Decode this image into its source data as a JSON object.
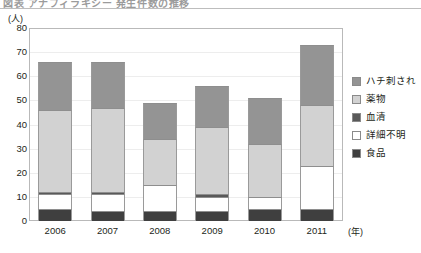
{
  "title": "図表 アナフィラキシー 発生件数の推移",
  "y_unit": "(人)",
  "x_unit": "(年)",
  "legend": [
    {
      "label": "ハチ刺され",
      "color": "#949494"
    },
    {
      "label": "薬物",
      "color": "#d2d2d2"
    },
    {
      "label": "血清",
      "color": "#595959"
    },
    {
      "label": "詳細不明",
      "color": "#ffffff"
    },
    {
      "label": "食品",
      "color": "#3f3f3f"
    }
  ],
  "chart_data": {
    "type": "bar",
    "stacked": true,
    "title": "図表 アナフィラキシー 発生件数の推移",
    "xlabel": "(年)",
    "ylabel": "(人)",
    "ylim": [
      0,
      80
    ],
    "yticks": [
      0,
      10,
      20,
      30,
      40,
      50,
      60,
      70,
      80
    ],
    "grid": true,
    "legend_position": "right",
    "categories": [
      "2006",
      "2007",
      "2008",
      "2009",
      "2010",
      "2011"
    ],
    "series": [
      {
        "name": "食品",
        "color": "#3f3f3f",
        "values": [
          5,
          4,
          4,
          4,
          5,
          5
        ]
      },
      {
        "name": "詳細不明",
        "color": "#ffffff",
        "values": [
          6,
          7,
          11,
          6,
          5,
          18
        ]
      },
      {
        "name": "血清",
        "color": "#595959",
        "values": [
          1,
          1,
          0,
          1,
          0,
          0
        ]
      },
      {
        "name": "薬物",
        "color": "#d2d2d2",
        "values": [
          34,
          35,
          19,
          28,
          22,
          25
        ]
      },
      {
        "name": "ハチ刺され",
        "color": "#949494",
        "values": [
          20,
          19,
          15,
          17,
          19,
          25
        ]
      }
    ],
    "totals": [
      66,
      66,
      49,
      56,
      51,
      73
    ]
  }
}
